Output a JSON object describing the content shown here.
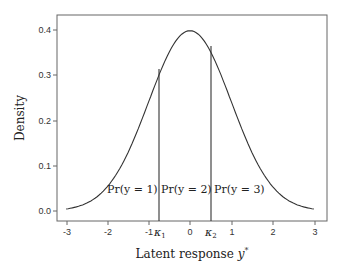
{
  "chart_data": {
    "type": "line",
    "title": "",
    "xlabel": "Latent response y*",
    "ylabel": "Density",
    "xlim": [
      -3.3,
      3.3
    ],
    "ylim": [
      -0.02,
      0.44
    ],
    "grid": false,
    "xticks": [
      "-3",
      "-2",
      "-1",
      "0",
      "1",
      "2",
      "3"
    ],
    "yticks": [
      "0.0",
      "0.1",
      "0.2",
      "0.3",
      "0.4"
    ],
    "series": [
      {
        "name": "Standard normal density",
        "x": [
          -3,
          -2.5,
          -2,
          -1.5,
          -1,
          -0.5,
          0,
          0.5,
          1,
          1.5,
          2,
          2.5,
          3
        ],
        "y": [
          0.004,
          0.018,
          0.054,
          0.13,
          0.242,
          0.352,
          0.399,
          0.352,
          0.242,
          0.13,
          0.054,
          0.018,
          0.004
        ]
      }
    ],
    "thresholds": [
      {
        "label": "κ1",
        "x": -0.75
      },
      {
        "label": "κ2",
        "x": 0.5
      }
    ],
    "annotations": [
      "Pr(y = 1)",
      "Pr(y = 2)",
      "Pr(y = 3)"
    ]
  },
  "labels": {
    "xlabel_main": "Latent response ",
    "xlabel_var": "y",
    "xlabel_sup": "*",
    "ylabel": "Density",
    "kappa1": "κ",
    "kappa1_sub": "1",
    "kappa2": "κ",
    "kappa2_sub": "2",
    "pr1": "Pr(y = 1)",
    "pr2": "Pr(y = 2)",
    "pr3": "Pr(y = 3)",
    "xt": [
      "-3",
      "-2",
      "-1",
      "0",
      "1",
      "2",
      "3"
    ],
    "yt": [
      "0.0",
      "0.1",
      "0.2",
      "0.3",
      "0.4"
    ]
  }
}
